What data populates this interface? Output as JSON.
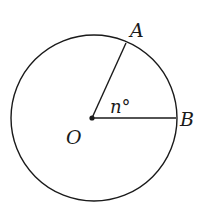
{
  "diagram": {
    "type": "circle-central-angle",
    "center_label": "O",
    "point_labels": [
      "A",
      "B"
    ],
    "angle_label": "n°",
    "angle_symbol": "°",
    "angle_var": "n",
    "colors": {
      "stroke": "#1a1a1a",
      "background": "#ffffff"
    }
  }
}
